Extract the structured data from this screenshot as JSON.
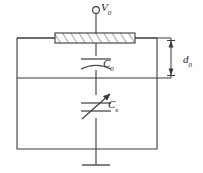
{
  "figure": {
    "type": "schematic-diagram",
    "background_color": "#ffffff",
    "line_color": "#3a3a3a",
    "text_color": "#1a1a1a"
  },
  "labels": {
    "source_symbol": "V",
    "source_subscript": "0",
    "fixed_capacitor_symbol": "C",
    "fixed_capacitor_subscript": "0",
    "variable_capacitor_symbol": "C",
    "variable_capacitor_subscript": "x",
    "gap_symbol": "d",
    "gap_subscript": "0"
  },
  "components": {
    "terminal": "open-circle-terminal",
    "electrode": "hatched-electrode-plate",
    "fixed_capacitor": "capacitor-polarized",
    "variable_capacitor": "capacitor-variable",
    "ground": "ground-terminal",
    "dimension": "double-arrow-dimension"
  }
}
